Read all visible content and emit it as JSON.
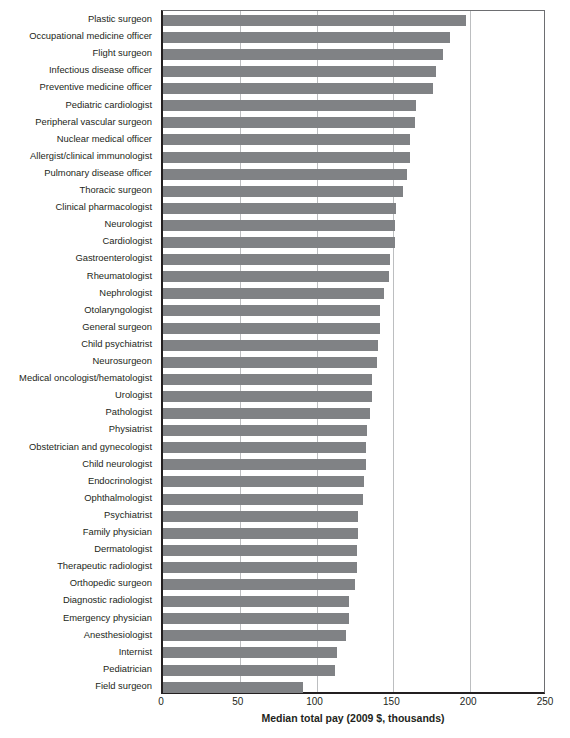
{
  "chart_data": {
    "type": "bar",
    "orientation": "horizontal",
    "title": "",
    "xlabel": "Median total pay (2009 $, thousands)",
    "ylabel": "",
    "xlim": [
      0,
      250
    ],
    "xticks": [
      0,
      50,
      100,
      150,
      200,
      250
    ],
    "xtick_labels": [
      "0",
      "50",
      "100",
      "150",
      "200",
      "250"
    ],
    "grid": "vertical",
    "legend": "none",
    "bar_color": "#808285",
    "categories": [
      "Plastic surgeon",
      "Occupational medicine officer",
      "Flight surgeon",
      "Infectious disease officer",
      "Preventive medicine officer",
      "Pediatric cardiologist",
      "Peripheral vascular surgeon",
      "Nuclear medical officer",
      "Allergist/clinical immunologist",
      "Pulmonary disease officer",
      "Thoracic surgeon",
      "Clinical pharmacologist",
      "Neurologist",
      "Cardiologist",
      "Gastroenterologist",
      "Rheumatologist",
      "Nephrologist",
      "Otolaryngologist",
      "General surgeon",
      "Child psychiatrist",
      "Neurosurgeon",
      "Medical oncologist/hematologist",
      "Urologist",
      "Pathologist",
      "Physiatrist",
      "Obstetrician and gynecologist",
      "Child neurologist",
      "Endocrinologist",
      "Ophthalmologist",
      "Psychiatrist",
      "Family physician",
      "Dermatologist",
      "Therapeutic radiologist",
      "Orthopedic surgeon",
      "Diagnostic radiologist",
      "Emergency physician",
      "Anesthesiologist",
      "Internist",
      "Pediatrician",
      "Field surgeon"
    ],
    "values": [
      197,
      187,
      182,
      178,
      176,
      165,
      164,
      161,
      161,
      159,
      156,
      152,
      151,
      151,
      148,
      147,
      144,
      141,
      141,
      140,
      139,
      136,
      136,
      135,
      133,
      132,
      132,
      131,
      130,
      127,
      127,
      126,
      126,
      125,
      121,
      121,
      119,
      113,
      112,
      91
    ],
    "units": "thousands of 2009 US dollars"
  }
}
